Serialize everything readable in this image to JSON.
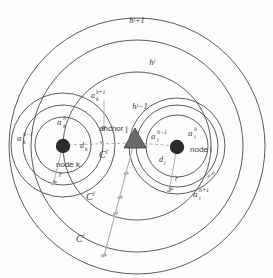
{
  "figure": {
    "background_color": "#fdfdfd",
    "stroke_color": "#4a4a4a",
    "node_fill": "#2b2b2b",
    "anchor_fill": "#6b6b6b",
    "dash_color": "#8a8a8a"
  },
  "outer_rings": [
    {
      "name": "ring-hj-plus-1",
      "label": "hʲ+1",
      "label_x": 137,
      "label_y": 23
    },
    {
      "name": "ring-hj",
      "label": "hʲ",
      "label_x": 152,
      "label_y": 65
    },
    {
      "name": "ring-hj-minus-1",
      "label": "hʲ−1",
      "label_x": 140,
      "label_y": 109
    }
  ],
  "node_k": {
    "name": "node-k",
    "label": "node k",
    "label_x": 56,
    "label_y": 166,
    "rings": [
      {
        "label_base": "a",
        "sub": "k",
        "sup": "h−1",
        "x": 21,
        "y": 140
      },
      {
        "label_base": "a",
        "sub": "k",
        "sup": "h",
        "x": 60,
        "y": 124
      },
      {
        "label_base": "a",
        "sub": "k",
        "sup": "h+1",
        "x": 94,
        "y": 97
      }
    ],
    "distance_label": {
      "base": "d",
      "sub": "k",
      "x": 82,
      "y": 149
    },
    "radius_label": {
      "text": "r",
      "x": 62,
      "y": 177
    }
  },
  "node_i": {
    "name": "node-i",
    "label": "node i",
    "label_x": 197,
    "label_y": 152,
    "rings": [
      {
        "label_base": "a",
        "sub": "i",
        "sup": "h−1",
        "x": 155,
        "y": 138
      },
      {
        "label_base": "a",
        "sub": "i",
        "sup": "h",
        "x": 190,
        "y": 135
      },
      {
        "label_base": "a",
        "sub": "i",
        "sup": "h+1",
        "x": 196,
        "y": 196
      }
    ],
    "distance_label": {
      "base": "d",
      "sub": "i",
      "x": 162,
      "y": 162
    },
    "radius_label": {
      "text": "r",
      "x": 176,
      "y": 182
    }
  },
  "anchor": {
    "name": "anchor-j",
    "label": "anchor j",
    "label_x": 99,
    "label_y": 130
  },
  "cj_labels": [
    {
      "text": "C",
      "sup": "j",
      "x": 103,
      "y": 157
    },
    {
      "text": "C",
      "sup": "j",
      "x": 89,
      "y": 198
    },
    {
      "text": "C",
      "sup": "j",
      "x": 79,
      "y": 240
    }
  ]
}
